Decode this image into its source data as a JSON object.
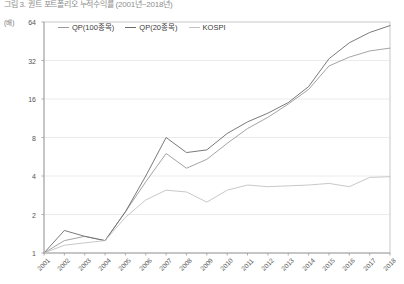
{
  "title": "그림 3. 퀀트 포트폴리오 누적수익률 (2001년~2018년)",
  "axis_unit_label": "(배)",
  "legend": [
    {
      "label": "QP(100종목)",
      "color": "#9a9a9a"
    },
    {
      "label": "QP(20종목)",
      "color": "#6b6b6b"
    },
    {
      "label": "KOSPI",
      "color": "#c2c2c2"
    }
  ],
  "chart_data": {
    "type": "line",
    "title": "그림 3. 퀀트 포트폴리오 누적수익률 (2001년~2018년)",
    "xlabel": "",
    "ylabel": "(배)",
    "yscale": "log",
    "ylim": [
      1,
      64
    ],
    "yticks": [
      1,
      2,
      4,
      8,
      16,
      32,
      64
    ],
    "grid": true,
    "legend_position": "top-left",
    "categories": [
      "2001",
      "2002",
      "2003",
      "2004",
      "2005",
      "2006",
      "2007",
      "2008",
      "2009",
      "2010",
      "2011",
      "2012",
      "2013",
      "2014",
      "2015",
      "2016",
      "2017",
      "2018"
    ],
    "series": [
      {
        "name": "QP(100종목)",
        "color": "#9a9a9a",
        "values": [
          1.0,
          1.25,
          1.35,
          1.25,
          2.1,
          3.6,
          6.0,
          4.6,
          5.4,
          7.2,
          9.4,
          11.5,
          14.6,
          19.0,
          29.0,
          34.0,
          38.0,
          40.0
        ]
      },
      {
        "name": "QP(20종목)",
        "color": "#6b6b6b",
        "values": [
          1.0,
          1.5,
          1.35,
          1.25,
          2.1,
          4.0,
          8.0,
          6.1,
          6.4,
          8.6,
          10.6,
          12.4,
          15.0,
          20.0,
          33.0,
          44.0,
          53.0,
          60.0
        ]
      },
      {
        "name": "KOSPI",
        "color": "#c2c2c2",
        "values": [
          1.0,
          1.15,
          1.2,
          1.25,
          1.9,
          2.6,
          3.1,
          3.0,
          2.5,
          3.1,
          3.4,
          3.3,
          3.35,
          3.4,
          3.5,
          3.3,
          3.9,
          3.95
        ]
      }
    ]
  }
}
